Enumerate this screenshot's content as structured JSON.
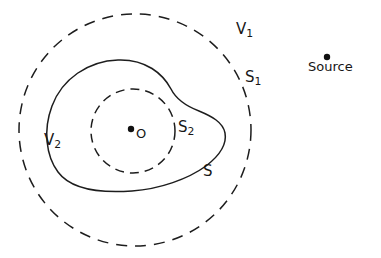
{
  "figure": {
    "background_color": "#ffffff",
    "stroke_color": "#1d1d1d",
    "width": 381,
    "height": 258
  },
  "labels": {
    "outer_region": {
      "base": "V",
      "sub": "1",
      "x": 236,
      "y": 22
    },
    "outer_surface": {
      "base": "S",
      "sub": "1",
      "x": 245,
      "y": 70
    },
    "inner_surface": {
      "base": "S",
      "sub": "2",
      "x": 178,
      "y": 120
    },
    "middle_region": {
      "base": "V",
      "sub": "2",
      "x": 44,
      "y": 133
    },
    "middle_surface": {
      "base": "S",
      "sub": "",
      "x": 203,
      "y": 164
    },
    "origin": {
      "base": "O",
      "sub": "",
      "x": 136,
      "y": 127
    },
    "source": {
      "base": "Source",
      "sub": "",
      "x": 308,
      "y": 60
    }
  },
  "shapes": {
    "outer_circle": {
      "name": "S1",
      "style": "dashed",
      "center_x": 135,
      "center_y": 130,
      "radius": 116
    },
    "inner_circle": {
      "name": "S2",
      "style": "dashed",
      "center_x": 133,
      "center_y": 131,
      "radius": 42
    },
    "blob_curve": {
      "name": "S",
      "style": "solid",
      "path": "M 118 60 C 88 61 62 79 52 106 C 43 130 46 156 58 172 C 72 191 104 193 132 191 C 160 189 188 179 206 166 C 219 156 227 144 225 133 C 223 122 211 116 199 111 C 186 106 176 99 171 89 C 163 74 146 59 118 60 Z"
    },
    "origin_dot": {
      "name": "O",
      "center_x": 131,
      "center_y": 129,
      "radius": 3.2
    },
    "source_dot": {
      "name": "Source",
      "center_x": 327,
      "center_y": 57,
      "radius": 3.2
    }
  }
}
